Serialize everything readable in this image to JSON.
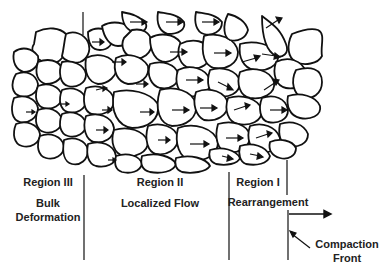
{
  "regions": [
    {
      "name": "Region III",
      "description": [
        "Bulk",
        "Deformation"
      ]
    },
    {
      "name": "Region II",
      "description": [
        "Localized Flow"
      ]
    },
    {
      "name": "Region I",
      "description": [
        "Rearrangement"
      ]
    }
  ],
  "front_label": [
    "Compaction",
    "Front"
  ],
  "colors": {
    "ink": "#111111",
    "background": "#ffffff"
  }
}
